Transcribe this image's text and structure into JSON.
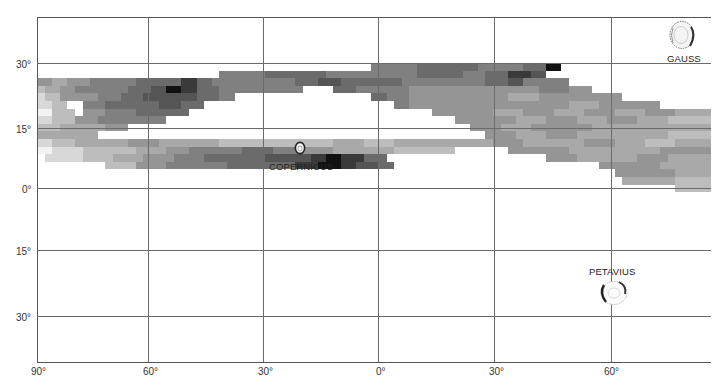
{
  "chart_data": {
    "type": "heatmap",
    "title": "",
    "xlabel": "Longitude",
    "ylabel": "Latitude",
    "x_ticks": [
      "90°",
      "60°",
      "30°",
      "0°",
      "30°",
      "60°"
    ],
    "y_ticks_north": [
      "30°",
      "15°",
      "0°"
    ],
    "y_ticks_south": [
      "15°",
      "30°"
    ],
    "x_range_deg": [
      -90,
      88
    ],
    "y_range_deg": [
      -45,
      40
    ],
    "grid": true,
    "shade_scale": {
      "0": "#f2f2f2",
      "1": "#d8d8d8",
      "2": "#bdbdbd",
      "3": "#a9a9a9",
      "4": "#959595",
      "5": "#808080",
      "6": "#6b6b6b",
      "7": "#555555",
      "8": "#3a3a3a",
      "9": "#111111"
    },
    "cell": {
      "x0": 37,
      "y0": 63,
      "w": 7.6,
      "h": 7.6
    },
    "rows": [
      [
        [
          44,
          50,
          5
        ],
        [
          50,
          58,
          6
        ],
        [
          58,
          61,
          5
        ],
        [
          61,
          64,
          5
        ],
        [
          64,
          67,
          6
        ],
        [
          67,
          69,
          9
        ]
      ],
      [
        [
          24,
          30,
          5
        ],
        [
          30,
          35,
          6
        ],
        [
          35,
          38,
          6
        ],
        [
          38,
          46,
          5
        ],
        [
          46,
          50,
          5
        ],
        [
          50,
          53,
          6
        ],
        [
          53,
          56,
          6
        ],
        [
          56,
          59,
          5
        ],
        [
          59,
          62,
          6
        ],
        [
          62,
          65,
          8
        ],
        [
          65,
          67,
          7
        ]
      ],
      [
        [
          0,
          2,
          4
        ],
        [
          2,
          4,
          3
        ],
        [
          4,
          7,
          4
        ],
        [
          7,
          10,
          5
        ],
        [
          10,
          13,
          5
        ],
        [
          13,
          16,
          6
        ],
        [
          16,
          19,
          6
        ],
        [
          19,
          21,
          8
        ],
        [
          21,
          23,
          6
        ],
        [
          23,
          26,
          5
        ],
        [
          26,
          29,
          5
        ],
        [
          29,
          34,
          5
        ],
        [
          34,
          37,
          6
        ],
        [
          37,
          40,
          7
        ],
        [
          40,
          44,
          6
        ],
        [
          44,
          48,
          6
        ],
        [
          48,
          52,
          5
        ],
        [
          52,
          56,
          5
        ],
        [
          56,
          59,
          5
        ],
        [
          59,
          62,
          6
        ],
        [
          62,
          64,
          7
        ],
        [
          64,
          67,
          5
        ],
        [
          67,
          70,
          5
        ]
      ],
      [
        [
          0,
          1,
          2
        ],
        [
          1,
          3,
          3
        ],
        [
          3,
          5,
          4
        ],
        [
          5,
          8,
          5
        ],
        [
          8,
          12,
          5
        ],
        [
          12,
          15,
          6
        ],
        [
          15,
          17,
          7
        ],
        [
          17,
          19,
          9
        ],
        [
          19,
          21,
          8
        ],
        [
          21,
          24,
          6
        ],
        [
          24,
          27,
          5
        ],
        [
          27,
          31,
          5
        ],
        [
          31,
          35,
          5
        ],
        [
          39,
          42,
          6
        ],
        [
          42,
          45,
          5
        ],
        [
          45,
          49,
          5
        ],
        [
          49,
          54,
          4
        ],
        [
          54,
          58,
          4
        ],
        [
          58,
          62,
          4
        ],
        [
          62,
          66,
          4
        ],
        [
          66,
          70,
          5
        ],
        [
          70,
          73,
          4
        ]
      ],
      [
        [
          0,
          1,
          1
        ],
        [
          1,
          3,
          2
        ],
        [
          3,
          5,
          4
        ],
        [
          5,
          8,
          4
        ],
        [
          8,
          11,
          5
        ],
        [
          11,
          14,
          6
        ],
        [
          14,
          18,
          7
        ],
        [
          18,
          21,
          7
        ],
        [
          21,
          24,
          6
        ],
        [
          24,
          26,
          5
        ],
        [
          44,
          46,
          6
        ],
        [
          46,
          49,
          5
        ],
        [
          49,
          54,
          4
        ],
        [
          54,
          58,
          4
        ],
        [
          58,
          62,
          4
        ],
        [
          62,
          66,
          3
        ],
        [
          66,
          70,
          4
        ],
        [
          70,
          74,
          4
        ],
        [
          74,
          77,
          4
        ]
      ],
      [
        [
          0,
          2,
          1
        ],
        [
          2,
          4,
          2
        ],
        [
          6,
          9,
          5
        ],
        [
          9,
          12,
          6
        ],
        [
          12,
          16,
          6
        ],
        [
          16,
          19,
          7
        ],
        [
          19,
          22,
          6
        ],
        [
          47,
          49,
          5
        ],
        [
          49,
          53,
          4
        ],
        [
          53,
          57,
          4
        ],
        [
          57,
          61,
          4
        ],
        [
          61,
          66,
          4
        ],
        [
          66,
          70,
          4
        ],
        [
          70,
          74,
          3
        ],
        [
          74,
          78,
          4
        ],
        [
          78,
          82,
          4
        ]
      ],
      [
        [
          0,
          2,
          0
        ],
        [
          2,
          5,
          2
        ],
        [
          6,
          9,
          4
        ],
        [
          9,
          13,
          5
        ],
        [
          13,
          16,
          6
        ],
        [
          16,
          20,
          6
        ],
        [
          52,
          56,
          4
        ],
        [
          56,
          60,
          4
        ],
        [
          60,
          64,
          3
        ],
        [
          64,
          68,
          4
        ],
        [
          68,
          72,
          3
        ],
        [
          72,
          76,
          4
        ],
        [
          76,
          80,
          3
        ],
        [
          80,
          84,
          4
        ],
        [
          84,
          89,
          3
        ]
      ],
      [
        [
          0,
          2,
          1
        ],
        [
          2,
          5,
          2
        ],
        [
          5,
          8,
          4
        ],
        [
          8,
          11,
          5
        ],
        [
          11,
          14,
          5
        ],
        [
          14,
          17,
          5
        ],
        [
          55,
          59,
          4
        ],
        [
          59,
          63,
          4
        ],
        [
          63,
          67,
          3
        ],
        [
          67,
          71,
          4
        ],
        [
          71,
          75,
          3
        ],
        [
          75,
          79,
          4
        ],
        [
          79,
          83,
          3
        ],
        [
          83,
          89,
          2
        ]
      ],
      [
        [
          0,
          3,
          2
        ],
        [
          3,
          6,
          3
        ],
        [
          6,
          9,
          3
        ],
        [
          9,
          12,
          4
        ],
        [
          57,
          61,
          4
        ],
        [
          61,
          65,
          3
        ],
        [
          65,
          69,
          4
        ],
        [
          69,
          73,
          4
        ],
        [
          73,
          77,
          3
        ],
        [
          77,
          81,
          3
        ],
        [
          81,
          85,
          3
        ],
        [
          85,
          89,
          3
        ]
      ],
      [
        [
          0,
          2,
          3
        ],
        [
          2,
          5,
          3
        ],
        [
          5,
          8,
          3
        ],
        [
          59,
          63,
          4
        ],
        [
          63,
          67,
          3
        ],
        [
          67,
          71,
          4
        ],
        [
          71,
          75,
          3
        ],
        [
          75,
          79,
          3
        ],
        [
          79,
          83,
          3
        ],
        [
          83,
          89,
          2
        ]
      ],
      [
        [
          0,
          2,
          1
        ],
        [
          2,
          5,
          2
        ],
        [
          5,
          8,
          3
        ],
        [
          8,
          12,
          3
        ],
        [
          12,
          16,
          4
        ],
        [
          16,
          20,
          3
        ],
        [
          20,
          24,
          3
        ],
        [
          24,
          28,
          2
        ],
        [
          28,
          31,
          2
        ],
        [
          31,
          35,
          2
        ],
        [
          35,
          39,
          2
        ],
        [
          39,
          43,
          3
        ],
        [
          43,
          47,
          2
        ],
        [
          47,
          51,
          3
        ],
        [
          51,
          55,
          3
        ],
        [
          55,
          60,
          3
        ],
        [
          60,
          64,
          4
        ],
        [
          64,
          68,
          3
        ],
        [
          68,
          72,
          3
        ],
        [
          72,
          76,
          4
        ],
        [
          76,
          80,
          3
        ],
        [
          80,
          84,
          2
        ],
        [
          84,
          89,
          3
        ]
      ],
      [
        [
          0,
          2,
          0
        ],
        [
          2,
          6,
          1
        ],
        [
          6,
          9,
          2
        ],
        [
          9,
          13,
          2
        ],
        [
          13,
          17,
          3
        ],
        [
          17,
          20,
          4
        ],
        [
          20,
          23,
          5
        ],
        [
          23,
          27,
          5
        ],
        [
          27,
          31,
          6
        ],
        [
          31,
          35,
          5
        ],
        [
          35,
          39,
          4
        ],
        [
          39,
          43,
          3
        ],
        [
          43,
          47,
          3
        ],
        [
          47,
          51,
          2
        ],
        [
          51,
          55,
          2
        ],
        [
          62,
          66,
          4
        ],
        [
          66,
          70,
          4
        ],
        [
          70,
          74,
          3
        ],
        [
          74,
          78,
          3
        ],
        [
          78,
          82,
          3
        ],
        [
          82,
          86,
          4
        ],
        [
          86,
          89,
          4
        ]
      ],
      [
        [
          1,
          3,
          1
        ],
        [
          3,
          6,
          1
        ],
        [
          6,
          10,
          2
        ],
        [
          10,
          14,
          3
        ],
        [
          14,
          18,
          4
        ],
        [
          18,
          22,
          5
        ],
        [
          22,
          26,
          6
        ],
        [
          26,
          30,
          6
        ],
        [
          30,
          34,
          7
        ],
        [
          34,
          36,
          7
        ],
        [
          36,
          38,
          8
        ],
        [
          38,
          40,
          9
        ],
        [
          40,
          43,
          8
        ],
        [
          43,
          46,
          6
        ],
        [
          67,
          71,
          4
        ],
        [
          71,
          75,
          3
        ],
        [
          75,
          79,
          3
        ],
        [
          79,
          83,
          4
        ],
        [
          83,
          86,
          3
        ],
        [
          86,
          89,
          3
        ]
      ],
      [
        [
          9,
          13,
          2
        ],
        [
          13,
          17,
          4
        ],
        [
          17,
          21,
          5
        ],
        [
          21,
          25,
          5
        ],
        [
          25,
          30,
          6
        ],
        [
          30,
          34,
          6
        ],
        [
          34,
          37,
          8
        ],
        [
          37,
          40,
          9
        ],
        [
          40,
          42,
          8
        ],
        [
          42,
          45,
          7
        ],
        [
          45,
          47,
          6
        ],
        [
          74,
          78,
          4
        ],
        [
          78,
          82,
          4
        ],
        [
          82,
          86,
          3
        ],
        [
          86,
          89,
          3
        ]
      ],
      [
        [
          76,
          80,
          4
        ],
        [
          80,
          84,
          4
        ],
        [
          84,
          89,
          3
        ]
      ],
      [
        [
          77,
          80,
          3
        ],
        [
          80,
          84,
          3
        ],
        [
          84,
          89,
          2
        ]
      ],
      [
        [
          84,
          89,
          2
        ]
      ]
    ],
    "annotations": [
      {
        "label": "COPERNICUS",
        "lon_deg": -20,
        "lat_deg": 10
      },
      {
        "label": "GAUSS",
        "lon_deg": 80,
        "lat_deg": 36
      },
      {
        "label": "PETAVIUS",
        "lon_deg": 60,
        "lat_deg": -25
      }
    ]
  },
  "axes": {
    "x_labels": [
      {
        "text": "90°",
        "x": 30
      },
      {
        "text": "60°",
        "x": 143
      },
      {
        "text": "30°",
        "x": 257
      },
      {
        "text": "0°",
        "x": 375
      },
      {
        "text": "30°",
        "x": 489
      },
      {
        "text": "60°",
        "x": 604
      }
    ],
    "y_labels": [
      {
        "text": "30°",
        "y": 60
      },
      {
        "text": "15°",
        "y": 125
      },
      {
        "text": "0°",
        "y": 185
      },
      {
        "text": "15°",
        "y": 247
      },
      {
        "text": "30°",
        "y": 313
      }
    ]
  },
  "craters": {
    "copernicus": "COPERNICUS",
    "gauss": "GAUSS",
    "petavius": "PETAVIUS"
  }
}
